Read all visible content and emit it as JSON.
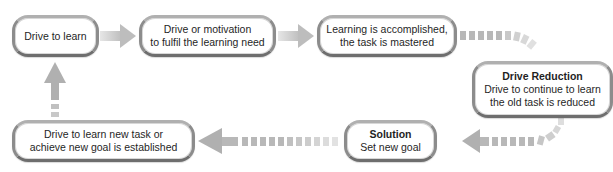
{
  "diagram": {
    "type": "cycle-flowchart",
    "colors": {
      "arrow": "#c4c4c4",
      "node_border": "#8c8c8c",
      "node_fill": "#ffffff",
      "text": "#1f1f1f"
    },
    "nodes": [
      {
        "id": "n1",
        "lines": [
          "Drive to learn"
        ]
      },
      {
        "id": "n2",
        "lines": [
          "Drive or motivation",
          "to fulfil the learning need"
        ]
      },
      {
        "id": "n3",
        "lines": [
          "Learning is accomplished,",
          "the task is mastered"
        ]
      },
      {
        "id": "n4",
        "title": "Drive Reduction",
        "lines": [
          "Drive to continue to learn",
          "the old task is reduced"
        ]
      },
      {
        "id": "n5",
        "title": "Solution",
        "lines": [
          "Set new goal"
        ]
      },
      {
        "id": "n6",
        "lines": [
          "Drive to learn new task or",
          "achieve new goal is established"
        ]
      }
    ],
    "edges": [
      {
        "from": "n1",
        "to": "n2",
        "style": "solid-gradient"
      },
      {
        "from": "n2",
        "to": "n3",
        "style": "solid-gradient"
      },
      {
        "from": "n3",
        "to": "n4",
        "style": "dashed-curve"
      },
      {
        "from": "n4",
        "to": "n5",
        "style": "dashed-curve"
      },
      {
        "from": "n5",
        "to": "n6",
        "style": "dashed"
      },
      {
        "from": "n6",
        "to": "n1",
        "style": "dashed-up"
      }
    ]
  }
}
